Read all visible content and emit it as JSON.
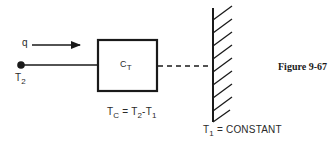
{
  "figure": {
    "caption": "Figure 9-67"
  },
  "diagram": {
    "heat_flow": {
      "symbol": "q"
    },
    "source_node": {
      "symbol": "T",
      "subscript": "2"
    },
    "capacitor": {
      "symbol": "C",
      "subscript": "T"
    },
    "equation": {
      "lhs": "T",
      "lhs_sub": "C",
      "eq": " = ",
      "t2": "T",
      "t2_sub": "2",
      "minus": "-",
      "t1": "T",
      "t1_sub": "1"
    },
    "ground": {
      "symbol": "T",
      "subscript": "1",
      "text": " = CONSTANT"
    },
    "colors": {
      "line": "#1a1a1a",
      "background": "#ffffff"
    }
  }
}
